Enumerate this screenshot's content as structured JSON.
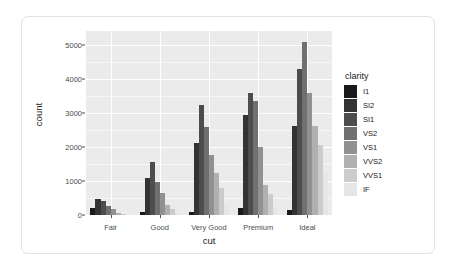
{
  "chart_data": {
    "type": "bar",
    "title": "",
    "subtitle": "",
    "xlabel": "cut",
    "ylabel": "count",
    "categories": [
      "Fair",
      "Good",
      "Very Good",
      "Premium",
      "Ideal"
    ],
    "xtick_labels": [
      "Fair",
      "Good",
      "Very Good",
      "Premium",
      "Ideal"
    ],
    "ytick_labels": [
      "0",
      "1000",
      "2000",
      "3000",
      "4000",
      "5000"
    ],
    "ytick_values": [
      0,
      1000,
      2000,
      3000,
      4000,
      5000
    ],
    "ylim": [
      0,
      5400
    ],
    "grid": true,
    "grid_major": true,
    "grid_minor": true,
    "legend_position": "right",
    "legend_title": "clarity",
    "series": [
      {
        "name": "I1",
        "color": "#1a1a1a",
        "values": [
          210,
          96,
          84,
          205,
          146
        ]
      },
      {
        "name": "SI2",
        "color": "#333333",
        "values": [
          466,
          1081,
          2100,
          2949,
          2598
        ]
      },
      {
        "name": "SI1",
        "color": "#4d4d4d",
        "values": [
          408,
          1560,
          3240,
          3575,
          4282
        ]
      },
      {
        "name": "VS2",
        "color": "#707070",
        "values": [
          261,
          978,
          2591,
          3357,
          5071
        ]
      },
      {
        "name": "VS1",
        "color": "#919191",
        "values": [
          170,
          648,
          1775,
          1989,
          3589
        ]
      },
      {
        "name": "VVS2",
        "color": "#b0b0b0",
        "values": [
          69,
          286,
          1235,
          870,
          2606
        ]
      },
      {
        "name": "VVS1",
        "color": "#cccccc",
        "values": [
          17,
          186,
          789,
          616,
          2047
        ]
      },
      {
        "name": "IF",
        "color": "#e6e6e6",
        "values": [
          9,
          71,
          268,
          230,
          1212
        ]
      }
    ]
  },
  "axes": {
    "y_title": "count",
    "x_title": "cut"
  },
  "legend": {
    "title": "clarity",
    "entries": [
      {
        "label": "I1",
        "color": "#1a1a1a"
      },
      {
        "label": "SI2",
        "color": "#333333"
      },
      {
        "label": "SI1",
        "color": "#4d4d4d"
      },
      {
        "label": "VS2",
        "color": "#707070"
      },
      {
        "label": "VS1",
        "color": "#919191"
      },
      {
        "label": "VVS2",
        "color": "#b0b0b0"
      },
      {
        "label": "VVS1",
        "color": "#cccccc"
      },
      {
        "label": "IF",
        "color": "#e6e6e6"
      }
    ]
  },
  "theme": {
    "panel_background": "#ebebeb",
    "grid_major_color": "#ffffff",
    "grid_minor_color": "#f7f7f7",
    "card_background": "#ffffff",
    "card_border": "#e2e2e2",
    "text_color": "#1a1a1a",
    "axis_text_color": "#4d4d4d"
  }
}
